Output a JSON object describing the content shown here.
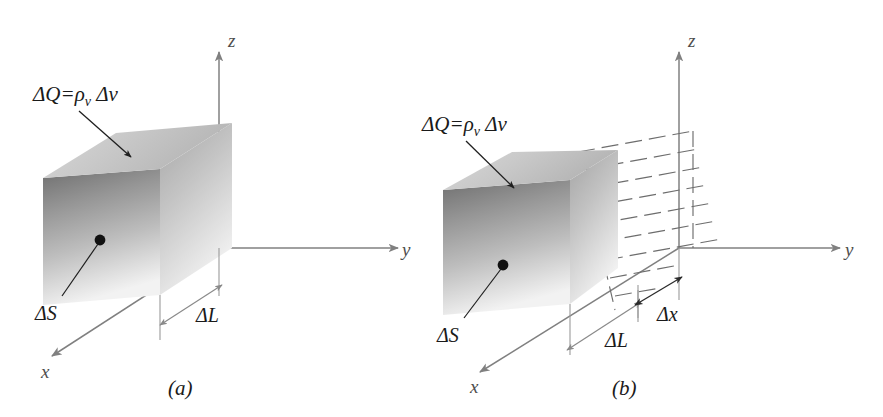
{
  "figure": {
    "background_color": "#ffffff",
    "ink_color": "#1a1a1a",
    "axis_color": "#808080",
    "dimension_color": "#8a8a8a",
    "panels": [
      {
        "id": "panel-a",
        "caption": "(a)",
        "charge_label": "ΔQ=ρ",
        "charge_label_subscript": "v",
        "charge_label_tail": " Δv",
        "surface_label": "ΔS",
        "axes": {
          "z": "z",
          "y": "y",
          "x": "x"
        },
        "dimensions": [
          {
            "name": "delta-L",
            "label": "ΔL"
          }
        ]
      },
      {
        "id": "panel-b",
        "caption": "(b)",
        "charge_label": "ΔQ=ρ",
        "charge_label_subscript": "v",
        "charge_label_tail": " Δv",
        "surface_label": "ΔS",
        "axes": {
          "z": "z",
          "y": "y",
          "x": "x"
        },
        "dimensions": [
          {
            "name": "delta-L",
            "label": "ΔL"
          },
          {
            "name": "delta-x",
            "label": "Δx"
          }
        ]
      }
    ]
  }
}
